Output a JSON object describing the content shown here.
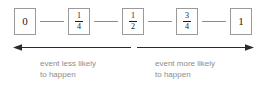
{
  "diagram": {
    "colors": {
      "box_border": "#9a9a9a",
      "connector": "#8d8d8d",
      "arrow": "#2b2b2b",
      "caption_text": "#8c8c8c",
      "value_text": "#1a1a1a",
      "background": "#ffffff"
    },
    "scale_points": [
      {
        "id": "zero",
        "kind": "whole",
        "label": "0",
        "numerator": "",
        "denominator": ""
      },
      {
        "id": "one-quarter",
        "kind": "fraction",
        "label": "1/4",
        "numerator": "1",
        "denominator": "4"
      },
      {
        "id": "one-half",
        "kind": "fraction",
        "label": "1/2",
        "numerator": "1",
        "denominator": "2"
      },
      {
        "id": "three-quarters",
        "kind": "fraction",
        "label": "3/4",
        "numerator": "3",
        "denominator": "4"
      },
      {
        "id": "one",
        "kind": "whole",
        "label": "1",
        "numerator": "",
        "denominator": ""
      }
    ],
    "captions": {
      "left": "event less likely\nto happen",
      "right": "event more likely\nto happen"
    }
  }
}
